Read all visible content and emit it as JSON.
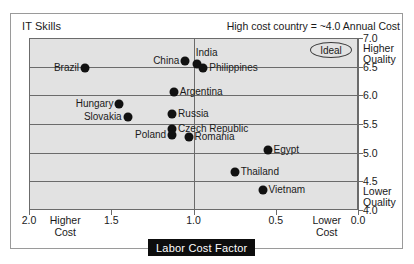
{
  "header": {
    "title": "IT Skills",
    "note": "High cost country = ~4.0 Annual Cost"
  },
  "badge": {
    "ideal_label": "Ideal"
  },
  "axes": {
    "x_title": "Labor Cost Factor",
    "x_ticks": [
      "2.0",
      "1.5",
      "1.0",
      "0.5",
      "0.0"
    ],
    "x_note_left": "Higher\nCost",
    "x_note_left_line1": "Higher",
    "x_note_left_line2": "Cost",
    "x_note_right_line1": "Lower",
    "x_note_right_line2": "Cost",
    "y_ticks": [
      "7.0",
      "6.5",
      "6.0",
      "5.5",
      "5.0",
      "4.5",
      "4.0"
    ],
    "y_note_top_line1": "Higher",
    "y_note_top_line2": "Quality",
    "y_note_bottom_line1": "Lower",
    "y_note_bottom_line2": "Quality"
  },
  "colors": {
    "plot_background": "#e2e2e2",
    "gridline": "#6b6b6b",
    "dot": "#111111",
    "axis_title_background": "#0d0d0d",
    "axis_title_text": "#ffffff",
    "frame": "#9a9a9a"
  },
  "chart_data": {
    "type": "scatter",
    "title": "IT Skills",
    "subtitle": "High cost country = ~4.0 Annual Cost",
    "xlabel": "Labor Cost Factor",
    "ylabel": "IT Skills",
    "xlim": [
      2.0,
      0.0
    ],
    "ylim": [
      4.0,
      7.0
    ],
    "x_inverted": true,
    "grid": true,
    "legend": false,
    "annotations": [
      {
        "text": "Ideal",
        "x": 0.18,
        "y": 6.85,
        "shape": "ellipse"
      },
      {
        "text": "Higher Cost",
        "position": "x-axis-left"
      },
      {
        "text": "Lower Cost",
        "position": "x-axis-right"
      },
      {
        "text": "Higher Quality",
        "position": "y-axis-top"
      },
      {
        "text": "Lower Quality",
        "position": "y-axis-bottom"
      }
    ],
    "points": [
      {
        "name": "Brazil",
        "x": 1.66,
        "y": 6.48,
        "label_side": "left"
      },
      {
        "name": "China",
        "x": 1.05,
        "y": 6.6,
        "label_side": "left"
      },
      {
        "name": "India",
        "x": 0.98,
        "y": 6.54,
        "label_side": "right-above"
      },
      {
        "name": "Philippines",
        "x": 0.94,
        "y": 6.48,
        "label_side": "right"
      },
      {
        "name": "Argentina",
        "x": 1.12,
        "y": 6.06,
        "label_side": "right"
      },
      {
        "name": "Hungary",
        "x": 1.45,
        "y": 5.85,
        "label_side": "left"
      },
      {
        "name": "Russia",
        "x": 1.13,
        "y": 5.68,
        "label_side": "right"
      },
      {
        "name": "Slovakia",
        "x": 1.4,
        "y": 5.62,
        "label_side": "left"
      },
      {
        "name": "Czech Republic",
        "x": 1.13,
        "y": 5.42,
        "label_side": "right"
      },
      {
        "name": "Poland",
        "x": 1.13,
        "y": 5.3,
        "label_side": "left"
      },
      {
        "name": "Romania",
        "x": 1.03,
        "y": 5.27,
        "label_side": "right"
      },
      {
        "name": "Egypt",
        "x": 0.55,
        "y": 5.05,
        "label_side": "right"
      },
      {
        "name": "Thailand",
        "x": 0.75,
        "y": 4.67,
        "label_side": "right"
      },
      {
        "name": "Vietnam",
        "x": 0.58,
        "y": 4.35,
        "label_side": "right"
      }
    ]
  }
}
